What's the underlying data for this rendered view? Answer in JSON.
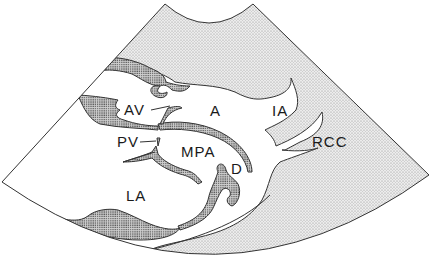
{
  "figure": {
    "type": "echocardiographic sector diagram",
    "background_color": "#ffffff",
    "light_stipple_color": "#d8d8d8",
    "dark_stipple_color": "#9a9a9a",
    "line_color": "#333333"
  },
  "labels": [
    {
      "id": "av",
      "text": "AV",
      "x": 124,
      "y": 115
    },
    {
      "id": "a",
      "text": "A",
      "x": 210,
      "y": 115
    },
    {
      "id": "ia",
      "text": "IA",
      "x": 272,
      "y": 115
    },
    {
      "id": "pv",
      "text": "PV",
      "x": 117,
      "y": 147
    },
    {
      "id": "mpa",
      "text": "MPA",
      "x": 181,
      "y": 159
    },
    {
      "id": "rcc",
      "text": "RCC",
      "x": 312,
      "y": 147
    },
    {
      "id": "d",
      "text": "D",
      "x": 231,
      "y": 174
    },
    {
      "id": "la",
      "text": "LA",
      "x": 126,
      "y": 200
    }
  ]
}
